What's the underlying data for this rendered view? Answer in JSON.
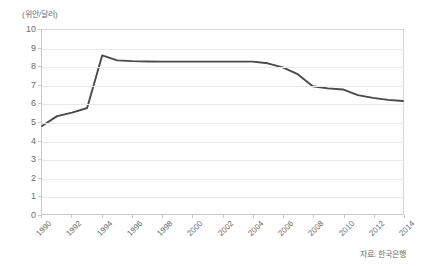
{
  "chart_data": {
    "type": "line",
    "title": "",
    "subtitle": "",
    "unit_label": "(위안/달러)",
    "xlabel": "",
    "ylabel": "",
    "ylim": [
      0,
      10
    ],
    "xlim": [
      1990,
      2014
    ],
    "y_ticks": [
      "0",
      "1",
      "2",
      "3",
      "4",
      "5",
      "6",
      "7",
      "8",
      "9",
      "10"
    ],
    "x_tick_labels": [
      "1990",
      "1992",
      "1994",
      "1996",
      "1998",
      "2000",
      "2002",
      "2004",
      "2006",
      "2008",
      "2010",
      "2012",
      "2014"
    ],
    "grid": true,
    "legend": "none",
    "line_color": "#4a4a4a",
    "x": [
      1990,
      1991,
      1992,
      1993,
      1994,
      1995,
      1996,
      1997,
      1998,
      1999,
      2000,
      2001,
      2002,
      2003,
      2004,
      2005,
      2006,
      2007,
      2008,
      2009,
      2010,
      2011,
      2012,
      2013,
      2014
    ],
    "series": [
      {
        "name": "위안/달러 환율",
        "values": [
          4.78,
          5.32,
          5.51,
          5.76,
          8.62,
          8.35,
          8.31,
          8.29,
          8.28,
          8.28,
          8.28,
          8.28,
          8.28,
          8.28,
          8.28,
          8.19,
          7.97,
          7.6,
          6.94,
          6.83,
          6.77,
          6.46,
          6.31,
          6.2,
          6.14
        ]
      }
    ],
    "source_note": "자료: 한국은행"
  }
}
